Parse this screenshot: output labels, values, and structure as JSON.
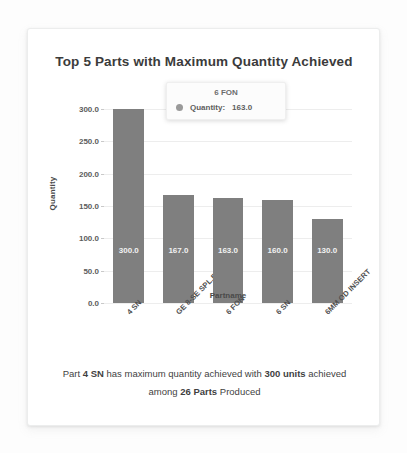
{
  "chart_data": {
    "type": "bar",
    "title": "Top 5 Parts with Maximum Quantity Achieved",
    "xlabel": "Partname",
    "ylabel": "Quantity",
    "categories": [
      "4 SN",
      "GE 8-SE SPL.BODY",
      "6 FON",
      "6 SN",
      "6MM OD INSERT"
    ],
    "values": [
      300.0,
      167.0,
      163.0,
      160.0,
      130.0
    ],
    "value_labels": [
      "300.0",
      "167.0",
      "163.0",
      "160.0",
      "130.0"
    ],
    "ylim": [
      0,
      300
    ],
    "yticks": [
      0.0,
      50.0,
      100.0,
      150.0,
      200.0,
      250.0,
      300.0
    ],
    "ytick_labels": [
      "0.0",
      "50.0",
      "100.0",
      "150.0",
      "200.0",
      "250.0",
      "300.0"
    ],
    "grid": true,
    "legend": "none",
    "bar_color": "#7f7f7f"
  },
  "tooltip": {
    "header": "6 FON",
    "series_label": "Quantity:",
    "value": "163.0",
    "marker_color": "#9a9a9a"
  },
  "footer": {
    "part_prefix": "Part ",
    "part_name": "4 SN",
    "middle": " has maximum quantity achieved with ",
    "units": "300 units",
    "achieved_among": " achieved among ",
    "parts_count": "26 Parts",
    "suffix": " Produced"
  }
}
